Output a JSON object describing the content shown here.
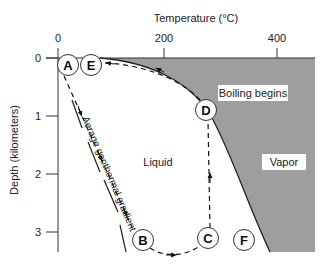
{
  "diagram": {
    "x_axis": {
      "title": "Temperature (°C)",
      "ticks": [
        {
          "label": "0",
          "value": 0
        },
        {
          "label": "200",
          "value": 200
        },
        {
          "label": "400",
          "value": 400
        }
      ]
    },
    "y_axis": {
      "title": "Depth (kilometers)",
      "ticks": [
        {
          "label": "0",
          "value": 0
        },
        {
          "label": "1",
          "value": 1
        },
        {
          "label": "2",
          "value": 2
        },
        {
          "label": "3",
          "value": 3
        }
      ]
    },
    "regions": {
      "liquid": "Liquid",
      "vapor": "Vapor"
    },
    "annotations": {
      "boiling": "Boiling begins",
      "gradient": "Aerage geothermal gradient"
    },
    "points": [
      {
        "id": "A",
        "label": "A"
      },
      {
        "id": "E",
        "label": "E"
      },
      {
        "id": "D",
        "label": "D"
      },
      {
        "id": "B",
        "label": "B"
      },
      {
        "id": "C",
        "label": "C"
      },
      {
        "id": "F",
        "label": "F"
      }
    ],
    "colors": {
      "vapor_fill": "#9e9e9e",
      "line": "#222222",
      "background": "#ffffff"
    }
  }
}
